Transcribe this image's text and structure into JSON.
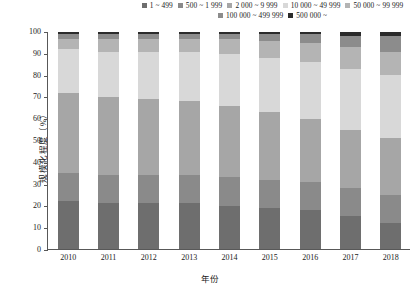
{
  "chart_data": {
    "type": "bar",
    "subtype": "stacked-100-percent",
    "title": "",
    "xlabel": "年份",
    "ylabel": "规模化程度（%）",
    "ylim": [
      0,
      100
    ],
    "yticks": [
      0,
      10,
      20,
      30,
      40,
      50,
      60,
      70,
      80,
      90,
      100
    ],
    "grid": false,
    "legend_position": "top",
    "categories": [
      "2010",
      "2011",
      "2012",
      "2013",
      "2014",
      "2015",
      "2016",
      "2017",
      "2018"
    ],
    "series": [
      {
        "name": "1 ~ 499",
        "color": "#6e6e6e",
        "values": [
          22,
          21,
          21,
          21,
          20,
          19,
          18,
          15,
          12
        ]
      },
      {
        "name": "500 ~ 1 999",
        "color": "#8a8a8a",
        "values": [
          13,
          13,
          13,
          13,
          13,
          13,
          13,
          13,
          13
        ]
      },
      {
        "name": "2 000 ~ 9 999",
        "color": "#a6a6a6",
        "values": [
          37,
          36,
          35,
          34,
          33,
          31,
          29,
          27,
          26
        ]
      },
      {
        "name": "10 000 ~ 49 999",
        "color": "#d8d8d8",
        "values": [
          20,
          21,
          22,
          23,
          24,
          25,
          26,
          28,
          29
        ]
      },
      {
        "name": "50 000 ~ 99 999",
        "color": "#b4b4b4",
        "values": [
          5,
          6,
          6,
          6,
          7,
          8,
          9,
          10,
          11
        ]
      },
      {
        "name": "100 000 ~ 499 999",
        "color": "#8c8c8c",
        "values": [
          2,
          2,
          2,
          2,
          2,
          3,
          4,
          5,
          7
        ]
      },
      {
        "name": "500 000 ~",
        "color": "#2b2b2b",
        "values": [
          1,
          1,
          1,
          1,
          1,
          1,
          1,
          2,
          2
        ]
      }
    ]
  }
}
